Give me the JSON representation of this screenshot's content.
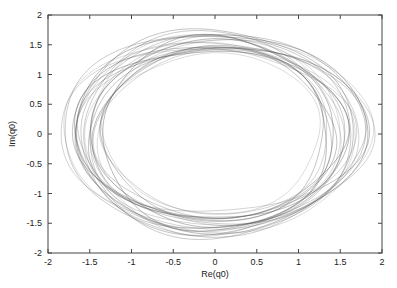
{
  "chart_data": {
    "type": "line",
    "title": "",
    "xlabel": "Re(q0)",
    "ylabel": "Im(q0)",
    "xlim": [
      -2,
      2
    ],
    "ylim": [
      -2,
      2
    ],
    "xticks": [
      -2,
      -1.5,
      -1,
      -0.5,
      0,
      0.5,
      1,
      1.5,
      2
    ],
    "yticks": [
      -2,
      -1.5,
      -1,
      -0.5,
      0,
      0.5,
      1,
      1.5,
      2
    ],
    "xtick_labels": [
      "-2",
      "-1.5",
      "-1",
      "-0.5",
      "0",
      "0.5",
      "1",
      "1.5",
      "2"
    ],
    "ytick_labels": [
      "-2",
      "-1.5",
      "-1",
      "-0.5",
      "0",
      "0.5",
      "1",
      "1.5",
      "2"
    ],
    "grid": false,
    "legend": null,
    "series": [
      {
        "name": "trajectory",
        "color": "#555555",
        "loops": [
          {
            "rx": 1.85,
            "ry": 1.62,
            "cx": 0.02,
            "cy": 0.0
          },
          {
            "rx": 1.8,
            "ry": 1.7,
            "cx": -0.03,
            "cy": 0.02
          },
          {
            "rx": 1.75,
            "ry": 1.66,
            "cx": 0.05,
            "cy": 0.03
          },
          {
            "rx": 1.7,
            "ry": 1.58,
            "cx": 0.0,
            "cy": -0.02
          },
          {
            "rx": 1.66,
            "ry": 1.72,
            "cx": -0.02,
            "cy": 0.04
          },
          {
            "rx": 1.62,
            "ry": 1.55,
            "cx": 0.04,
            "cy": -0.04
          },
          {
            "rx": 1.58,
            "ry": 1.62,
            "cx": -0.05,
            "cy": 0.0
          },
          {
            "rx": 1.55,
            "ry": 1.5,
            "cx": 0.03,
            "cy": 0.05
          },
          {
            "rx": 1.52,
            "ry": 1.6,
            "cx": 0.0,
            "cy": 0.02
          },
          {
            "rx": 1.48,
            "ry": 1.45,
            "cx": -0.04,
            "cy": -0.03
          },
          {
            "rx": 1.45,
            "ry": 1.56,
            "cx": 0.06,
            "cy": 0.01
          },
          {
            "rx": 1.42,
            "ry": 1.42,
            "cx": 0.0,
            "cy": 0.0
          },
          {
            "rx": 1.4,
            "ry": 1.52,
            "cx": -0.02,
            "cy": -0.05
          },
          {
            "rx": 1.36,
            "ry": 1.38,
            "cx": 0.03,
            "cy": 0.03
          },
          {
            "rx": 1.33,
            "ry": 1.48,
            "cx": 0.0,
            "cy": 0.01
          },
          {
            "rx": 1.3,
            "ry": 1.35,
            "cx": -0.03,
            "cy": 0.02
          },
          {
            "rx": 1.72,
            "ry": 1.48,
            "cx": 0.08,
            "cy": -0.01
          },
          {
            "rx": 1.64,
            "ry": 1.4,
            "cx": -0.06,
            "cy": 0.02
          },
          {
            "rx": 1.88,
            "ry": 1.52,
            "cx": 0.0,
            "cy": -0.03
          },
          {
            "rx": 1.78,
            "ry": 1.44,
            "cx": 0.04,
            "cy": 0.06
          },
          {
            "rx": 1.5,
            "ry": 1.68,
            "cx": -0.02,
            "cy": 0.01
          },
          {
            "rx": 1.6,
            "ry": 1.74,
            "cx": 0.01,
            "cy": -0.01
          },
          {
            "rx": 1.38,
            "ry": 1.64,
            "cx": 0.02,
            "cy": 0.0
          },
          {
            "rx": 1.68,
            "ry": 1.36,
            "cx": -0.01,
            "cy": 0.03
          }
        ]
      }
    ]
  }
}
